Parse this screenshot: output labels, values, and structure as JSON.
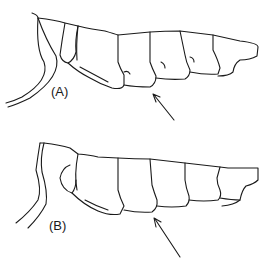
{
  "figure": {
    "panels": [
      {
        "label": "(A)",
        "arrow": "arrow pointing to lower tooth margin"
      },
      {
        "label": "(B)",
        "arrow": "arrow pointing to lower tooth margin"
      }
    ]
  }
}
